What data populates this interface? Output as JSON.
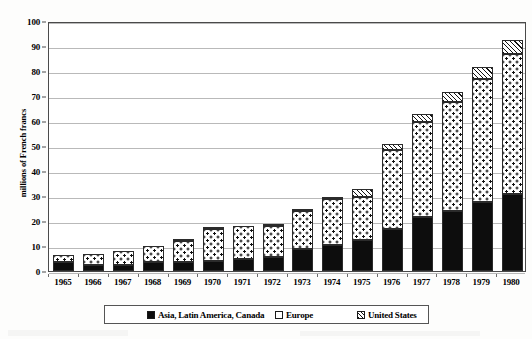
{
  "chart_data": {
    "type": "bar",
    "subtype": "stacked-bar",
    "title": "",
    "subtitle": "",
    "xlabel": "",
    "ylabel": "millions of French francs",
    "ylim": [
      0,
      100
    ],
    "ytick_step": 10,
    "yticks": [
      0,
      10,
      20,
      30,
      40,
      50,
      60,
      70,
      80,
      90,
      100
    ],
    "ytick_labels": [
      "0",
      "10",
      "20",
      "30",
      "40",
      "50",
      "60",
      "70",
      "80",
      "90",
      "100"
    ],
    "grid": true,
    "grid_axis": "y",
    "legend_position": "bottom",
    "categories": [
      "1965",
      "1966",
      "1967",
      "1968",
      "1969",
      "1970",
      "1971",
      "1972",
      "1973",
      "1974",
      "1975",
      "1976",
      "1977",
      "1978",
      "1979",
      "1980"
    ],
    "series": [
      {
        "name": "Asia, Latin America, Canada",
        "pattern": "solid-black",
        "color": "#0d0d0d",
        "values": [
          3.5,
          2.5,
          2.5,
          3.5,
          3.5,
          4.0,
          5.0,
          5.5,
          9.0,
          10.5,
          12.5,
          17.0,
          21.5,
          24.0,
          27.5,
          31.0
        ]
      },
      {
        "name": "Europe",
        "pattern": "dotted-white",
        "color": "#ffffff",
        "values": [
          3.0,
          4.5,
          5.5,
          6.5,
          8.5,
          13.0,
          13.0,
          12.5,
          15.0,
          18.5,
          17.0,
          31.5,
          38.0,
          43.5,
          49.5,
          56.0
        ]
      },
      {
        "name": "United States",
        "pattern": "diagonal-hatch",
        "color": "#ffffff",
        "values": [
          0.0,
          0.0,
          0.0,
          0.0,
          0.5,
          0.5,
          0.0,
          0.5,
          0.5,
          0.5,
          3.5,
          2.5,
          3.5,
          4.0,
          4.5,
          5.5
        ]
      }
    ],
    "totals": [
      6.5,
      7.0,
      8.0,
      10.0,
      12.5,
      17.5,
      18.0,
      18.5,
      24.5,
      29.5,
      33.0,
      51.0,
      63.0,
      71.5,
      81.5,
      92.5
    ]
  },
  "legend": {
    "items": [
      {
        "label": "Asia, Latin America, Canada",
        "swatch": "solid-black-swatch"
      },
      {
        "label": "Europe",
        "swatch": "white-swatch"
      },
      {
        "label": "United States",
        "swatch": "hatched-swatch"
      }
    ]
  }
}
